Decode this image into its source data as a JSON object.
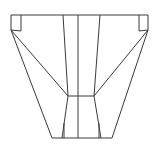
{
  "canvas": {
    "width": 157,
    "height": 153,
    "background_color": "#ffffff",
    "stroke_color": "#3a3a3a",
    "stroke_width": 1
  },
  "figure": {
    "title": "",
    "kind": "wireframe-line-drawing",
    "visible_text": []
  },
  "geometry": {
    "top_rail": {
      "name": "top-horizontal-rail",
      "points": "11,15 148,15"
    },
    "bottom_rail": {
      "name": "bottom-horizontal-rail",
      "points": "52,138 112,138"
    },
    "waist_rail": {
      "name": "waist-horizontal-rail",
      "points": "68,96 94,96"
    },
    "left_outer_edge": {
      "name": "left-outer-edge",
      "points": "11,15 11,30 52,138"
    },
    "right_outer_edge": {
      "name": "right-outer-edge",
      "points": "148,15 148,30 112,138"
    },
    "left_inner_tab": {
      "name": "left-inner-tab",
      "points": "21,15 21,31"
    },
    "right_inner_tab": {
      "name": "right-inner-tab",
      "points": "139,15 139,31"
    },
    "left_tab_diagonal": {
      "name": "left-tab-diagonal",
      "points": "11,30 21,31"
    },
    "right_tab_diagonal": {
      "name": "right-tab-diagonal",
      "points": "148,30 139,31"
    },
    "left_long_diagonal": {
      "name": "left-long-diagonal",
      "points": "11,30 68,96"
    },
    "right_long_diagonal": {
      "name": "right-long-diagonal",
      "points": "148,30 94,96"
    },
    "left_lower_diagonal": {
      "name": "left-lower-diagonal",
      "points": "68,96 62,138"
    },
    "right_lower_diagonal": {
      "name": "right-lower-diagonal",
      "points": "94,96 101,138"
    },
    "column_line_1": {
      "name": "column-line-left-outer",
      "points": "63,15 68,96"
    },
    "column_line_2": {
      "name": "column-line-left-inner",
      "points": "78,15 78,138"
    },
    "column_line_3": {
      "name": "column-line-right-inner",
      "points": "100,15 94,96"
    },
    "bottom_riser_left": {
      "name": "bottom-riser-left",
      "points": "64,123 64,138"
    },
    "bottom_riser_right": {
      "name": "bottom-riser-right",
      "points": "99,123 99,138"
    }
  }
}
